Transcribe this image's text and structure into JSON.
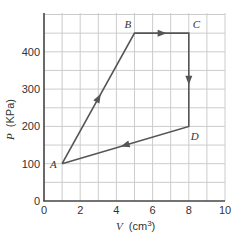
{
  "chart_data": {
    "type": "line",
    "title": "",
    "xlabel": "V (cm³)",
    "ylabel": "P (KPa)",
    "xlabel_var": "V",
    "xlabel_unit": "(cm",
    "xlabel_sup": "3",
    "xlabel_close": ")",
    "ylabel_var": "P",
    "ylabel_unit": "(KPa)",
    "xlim": [
      0,
      10
    ],
    "ylim": [
      0,
      475
    ],
    "xticks": [
      0,
      2,
      4,
      6,
      8,
      10
    ],
    "yticks": [
      0,
      100,
      200,
      300,
      400
    ],
    "grid": true,
    "grid_x_step": 1,
    "grid_y_step": 50,
    "points": [
      {
        "label": "A",
        "x": 1,
        "y": 100
      },
      {
        "label": "B",
        "x": 5,
        "y": 450
      },
      {
        "label": "C",
        "x": 8,
        "y": 450
      },
      {
        "label": "D",
        "x": 8,
        "y": 200
      }
    ],
    "path_order": [
      "A",
      "B",
      "C",
      "D",
      "A"
    ],
    "arrows": [
      {
        "segment": "A-B",
        "direction": "A to B"
      },
      {
        "segment": "B-C",
        "direction": "B to C"
      },
      {
        "segment": "C-D",
        "direction": "C to D"
      },
      {
        "segment": "D-A",
        "direction": "D to A"
      }
    ],
    "line_color": "#555555",
    "grid_color": "#cccccc",
    "axis_color": "#444444"
  }
}
